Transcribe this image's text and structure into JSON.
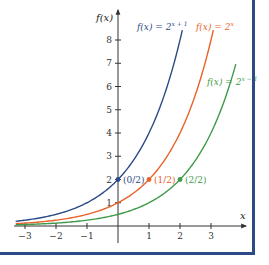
{
  "chart_data": {
    "type": "line",
    "title": "",
    "xlabel": "x",
    "ylabel": "f(x)",
    "xlim": [
      -3.3,
      3.8
    ],
    "ylim": [
      0,
      8.6
    ],
    "x_ticks": [
      -3,
      -2,
      -1,
      1,
      2,
      3
    ],
    "x_tick_labels": [
      "−3",
      "−2",
      "−1",
      "1",
      "2",
      "3"
    ],
    "y_ticks": [
      1,
      2,
      3,
      4,
      5,
      6,
      7,
      8
    ],
    "y_tick_labels": [
      "1",
      "2",
      "3",
      "4",
      "5",
      "6",
      "7",
      "8"
    ],
    "grid": false,
    "series": [
      {
        "name": "f(x) = 2^(x+1)",
        "label_base": "f(x) = 2",
        "label_exp": "x + 1",
        "color": "#2b4a86",
        "shift": 1,
        "x": [
          -3.3,
          -3,
          -2,
          -1,
          0,
          1,
          2
        ],
        "values": [
          0.203,
          0.25,
          0.5,
          1,
          2,
          4,
          8
        ],
        "point": {
          "x": 0,
          "y": 2,
          "label": "(0/2)"
        }
      },
      {
        "name": "f(x) = 2^x",
        "label_base": "f(x) = 2",
        "label_exp": "x",
        "color": "#e8622a",
        "shift": 0,
        "x": [
          -3.3,
          -3,
          -2,
          -1,
          0,
          1,
          2,
          3
        ],
        "values": [
          0.102,
          0.125,
          0.25,
          0.5,
          1,
          2,
          4,
          8
        ],
        "point": {
          "x": 1,
          "y": 2,
          "label": "(1/2)"
        }
      },
      {
        "name": "f(x) = 2^(x−1)",
        "label_base": "f(x) = 2",
        "label_exp": "x − 1",
        "color": "#3f9a4a",
        "shift": -1,
        "x": [
          -3.3,
          -3,
          -2,
          -1,
          0,
          1,
          2,
          3,
          3.8
        ],
        "values": [
          0.051,
          0.0625,
          0.125,
          0.25,
          0.5,
          1,
          2,
          4,
          6.96
        ],
        "point": {
          "x": 2,
          "y": 2,
          "label": "(2/2)"
        }
      }
    ],
    "annotations": [
      "(0/2)",
      "(1/2)",
      "(2/2)"
    ],
    "legend": "inline labels near curves"
  },
  "frame_color": "#2b4a86",
  "axis_color": "#333333"
}
